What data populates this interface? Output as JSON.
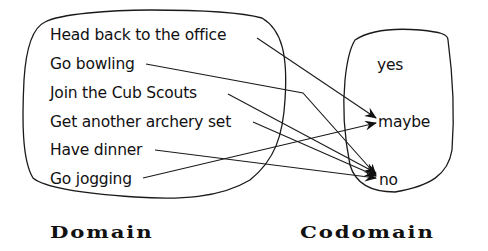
{
  "diagram": {
    "type": "function-mapping",
    "domain": {
      "label": "Domain",
      "items": [
        "Head back to the office",
        "Go bowling",
        "Join the Cub Scouts",
        "Get another archery set",
        "Have dinner",
        "Go jogging"
      ]
    },
    "codomain": {
      "label": "Codomain",
      "items": [
        "yes",
        "maybe",
        "no"
      ]
    },
    "mappings": [
      {
        "from": "Head back to the office",
        "to": "maybe"
      },
      {
        "from": "Go bowling",
        "to": "no"
      },
      {
        "from": "Join the Cub Scouts",
        "to": "no"
      },
      {
        "from": "Get another archery set",
        "to": "no"
      },
      {
        "from": "Have dinner",
        "to": "no"
      },
      {
        "from": "Go jogging",
        "to": "maybe"
      }
    ],
    "colors": {
      "stroke": "#1a1a1a",
      "background": "#ffffff"
    }
  }
}
